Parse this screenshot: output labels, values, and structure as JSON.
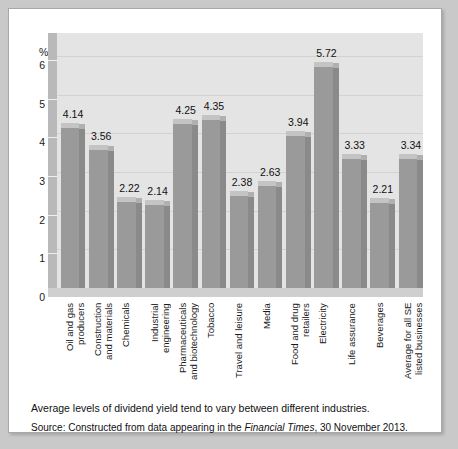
{
  "chart_data": {
    "type": "bar",
    "title": "",
    "xlabel": "",
    "ylabel": "%",
    "ylim": [
      0,
      6.6
    ],
    "yticks": [
      0,
      1,
      2,
      3,
      4,
      5,
      6
    ],
    "grid": true,
    "legend": "none",
    "style": "3d-column",
    "categories": [
      "Oil and gas producers",
      "Construction and materials",
      "Chemicals",
      "Industrial engineering",
      "Pharmaceuticals and biotechnology",
      "Tobacco",
      "Travel and leisure",
      "Media",
      "Food and drug retailers",
      "Electricity",
      "Life assurance",
      "Beverages",
      "Average for all SE listed businesses"
    ],
    "category_lines": [
      [
        "Oil and gas",
        "producers"
      ],
      [
        "Construction",
        "and materials"
      ],
      [
        "Chemicals"
      ],
      [
        "Industrial",
        "engineering"
      ],
      [
        "Pharmaceuticals",
        "and biotechnology"
      ],
      [
        "Tobacco"
      ],
      [
        "Travel and leisure"
      ],
      [
        "Media"
      ],
      [
        "Food and drug",
        "retailers"
      ],
      [
        "Electricity"
      ],
      [
        "Life assurance"
      ],
      [
        "Beverages"
      ],
      [
        "Average for all SE",
        "listed businesses"
      ]
    ],
    "values": [
      4.14,
      3.56,
      2.22,
      2.14,
      4.25,
      4.35,
      2.38,
      2.63,
      3.94,
      5.72,
      3.33,
      2.21,
      3.34
    ],
    "value_labels": [
      "4.14",
      "3.56",
      "2.22",
      "2.14",
      "4.25",
      "4.35",
      "2.38",
      "2.63",
      "3.94",
      "5.72",
      "3.33",
      "2.21",
      "3.34"
    ]
  },
  "axis": {
    "unit_label": "%",
    "ytick_labels": [
      "6",
      "5",
      "4",
      "3",
      "2",
      "1",
      "0"
    ]
  },
  "caption": {
    "main": "Average levels of dividend yield tend to vary between different industries.",
    "source_prefix": "Source: Constructed from data appearing in the ",
    "source_italic": "Financial Times",
    "source_suffix": ", 30 November 2013."
  },
  "colors": {
    "page_background": "#c9c9c9",
    "panel_background": "#ffffff",
    "plot_background": "#e4e4e4",
    "bar_front": "#9a9a9a",
    "bar_side": "#8a8a8a",
    "bar_top": "#c4c4c4",
    "axis_slab": "#b9b9b9",
    "floor": "#cfcfcf",
    "gridline": "#d2d2d2",
    "text": "#111111"
  }
}
